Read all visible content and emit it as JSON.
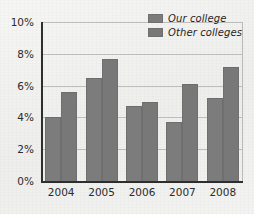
{
  "chart_data": {
    "type": "bar",
    "title": "",
    "xlabel": "",
    "ylabel": "",
    "categories": [
      "2004",
      "2005",
      "2006",
      "2007",
      "2008"
    ],
    "series": [
      {
        "name": "Our college",
        "values": [
          4.0,
          6.5,
          4.7,
          3.7,
          5.2
        ]
      },
      {
        "name": "Other colleges",
        "values": [
          5.6,
          7.7,
          5.0,
          6.1,
          7.15
        ]
      }
    ],
    "ylim": [
      0,
      10
    ],
    "ytick_values": [
      0,
      2,
      4,
      6,
      8,
      10
    ],
    "ytick_labels": [
      "0%",
      "2%",
      "4%",
      "6%",
      "8%",
      "10%"
    ],
    "grid": true,
    "legend_position": "top-right",
    "colors": {
      "series_1": "#7c7c7c",
      "series_2": "#787878",
      "axis": "#2e2e2e",
      "gridline": "#bdbdbb",
      "background": "#f1f1ef",
      "text": "#2b2b2b"
    }
  },
  "legend": {
    "items": [
      {
        "label": "Our college"
      },
      {
        "label": "Other colleges"
      }
    ]
  }
}
